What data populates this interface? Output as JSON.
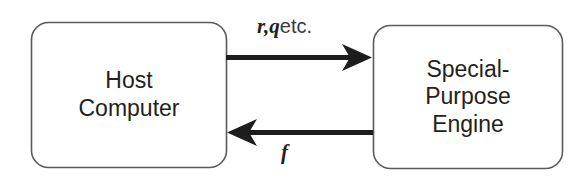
{
  "diagram": {
    "type": "block-diagram",
    "background_color": "#ffffff",
    "stroke_color": "#5a5a5a",
    "arrow_color": "#1d1d1d",
    "text_color": "#231f20",
    "nodes": [
      {
        "id": "host-computer",
        "shape": "rounded-rectangle",
        "lines": [
          "Host",
          "Computer"
        ],
        "line1": "Host",
        "line2": "Computer"
      },
      {
        "id": "special-purpose-engine",
        "shape": "rounded-rectangle",
        "lines": [
          "Special-",
          "Purpose",
          "Engine"
        ],
        "line1": "Special-",
        "line2": "Purpose",
        "line3": "Engine"
      }
    ],
    "edges": [
      {
        "id": "host-to-engine",
        "direction": "right",
        "from": "host-computer",
        "to": "special-purpose-engine",
        "label_symbol": "r,q",
        "label_plain": "etc."
      },
      {
        "id": "engine-to-host",
        "direction": "left",
        "from": "special-purpose-engine",
        "to": "host-computer",
        "label_symbol": "f",
        "label_plain": ""
      }
    ]
  }
}
